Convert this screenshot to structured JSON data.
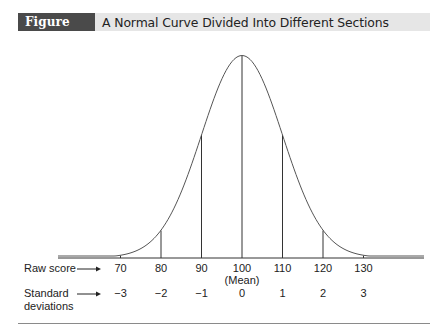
{
  "figure": {
    "label": "Figure 8.3",
    "title": "A Normal Curve Divided Into Different Sections"
  },
  "rows": {
    "raw_label": "Raw score",
    "sd_label_line1": "Standard",
    "sd_label_line2": "deviations",
    "mean_note": "(Mean)"
  },
  "chart_data": {
    "type": "line",
    "title": "A Normal Curve Divided Into Different Sections",
    "x": [
      70,
      80,
      90,
      100,
      110,
      120,
      130
    ],
    "raw_scores": [
      "70",
      "80",
      "90",
      "100",
      "110",
      "120",
      "130"
    ],
    "standard_deviations": [
      "−3",
      "−2",
      "−1",
      "0",
      "1",
      "2",
      "3"
    ],
    "mean": 100,
    "sd": 10,
    "mean_annotation": "(Mean)",
    "row_labels": [
      "Raw score",
      "Standard deviations"
    ],
    "xlabel": "",
    "ylabel": "",
    "grid": false,
    "legend": false
  }
}
